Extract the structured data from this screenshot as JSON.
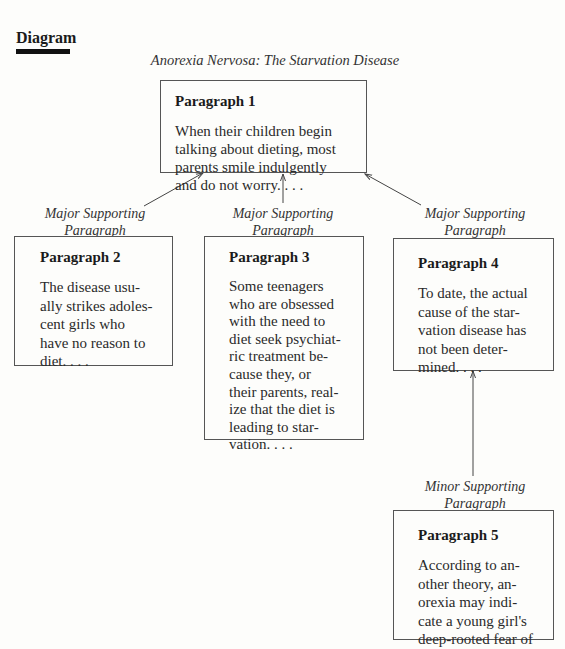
{
  "section": {
    "label": "Diagram"
  },
  "diagram": {
    "title": "Anorexia Nervosa: The Starvation Disease",
    "nodes": [
      {
        "id": "p1",
        "heading": "Paragraph 1",
        "text": "When their children begin\ntalking about dieting, most\nparents smile indulgently\nand do not worry. . . ."
      },
      {
        "id": "p2",
        "heading": "Paragraph 2",
        "text": "The disease usu-\nally strikes adoles-\ncent girls who\nhave no reason to\ndiet. . . ."
      },
      {
        "id": "p3",
        "heading": "Paragraph 3",
        "text": "Some teenagers\nwho are obsessed\nwith the need to\ndiet seek psychiat-\nric treatment be-\ncause they, or\ntheir parents, real-\nize that the diet is\nleading to star-\nvation. . . ."
      },
      {
        "id": "p4",
        "heading": "Paragraph 4",
        "text": "To date, the actual\ncause of the star-\nvation disease has\nnot been deter-\nmined. . . ."
      },
      {
        "id": "p5",
        "heading": "Paragraph 5",
        "text": "According to an-\nother theory, an-\norexia may indi-\ncate a young girl's\ndeep-rooted fear of"
      }
    ],
    "edge_labels": [
      {
        "from": "p2",
        "to": "p1",
        "text": "Major Supporting\nParagraph"
      },
      {
        "from": "p3",
        "to": "p1",
        "text": "Major Supporting\nParagraph"
      },
      {
        "from": "p4",
        "to": "p1",
        "text": "Major Supporting\nParagraph"
      },
      {
        "from": "p5",
        "to": "p4",
        "text": "Minor Supporting\nParagraph"
      }
    ]
  }
}
